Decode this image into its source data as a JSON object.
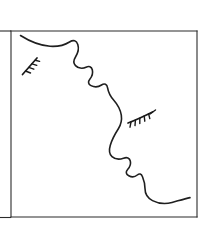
{
  "artwork": {
    "title": "Face in Profile Line Drawing",
    "description": "Minimal black ink line drawing of a human face seen in profile, contained in a thin rectangular frame, with two stylized eyelash marks.",
    "style": "line-art",
    "background_color": "#ffffff",
    "ink_color": "#1f1f1f",
    "frame_color": "#2b2b2b",
    "canvas": {
      "width": 209,
      "height": 233
    }
  },
  "frame": {
    "name": "rectangular-border",
    "left": 11,
    "top": 31,
    "right": 197,
    "bottom": 217,
    "stroke_width": 1.1,
    "color": "#2b2b2b"
  },
  "elements": {
    "profile_contour": {
      "label": "face-profile-contour",
      "color": "#1f1f1f",
      "stroke_width": 1.6,
      "segments": [
        "scalp",
        "forehead",
        "brow",
        "nose-bridge",
        "nose-tip",
        "upper-lip",
        "mouth",
        "lower-lip",
        "chin",
        "jaw-neck"
      ],
      "path": "M 20.5 35.5 C 30 41.5, 40 45.5, 50 46.3 C 58 46.8, 64.5 45.2, 69.5 42.0 C 73.5 39.5, 76.5 40.5, 77.8 44.5 C 79.0 48.2, 78.0 53.0, 75.5 57.0 C 73.6 60.0, 73.3 63.3, 75.5 65.6 C 78.0 68.2, 82.5 68.8, 86.0 67.2 C 89.0 65.8, 91.5 66.6, 92.3 69.8 C 93.1 73.0, 92.0 76.6, 89.8 79.2 C 87.8 81.6, 88.2 84.2, 91.0 85.6 C 94.2 87.2, 98.5 87.0, 101.5 85.0 C 104.5 83.0, 107.0 84.2, 107.6 87.8 C 108.4 92.5, 110.5 96.5, 113.8 100.2 C 117.8 104.7, 120.5 109.8, 121.3 115.2 C 122.0 120.0, 121.0 124.5, 118.5 128.5 C 115.0 134.0, 112.0 139.5, 110.3 145.2 C 108.8 150.3, 109.3 154.2, 112.0 156.6 C 114.8 159.1, 119.5 159.6, 123.5 158.2 C 127.0 157.0, 129.5 157.8, 130.3 161.0 C 131.0 163.8, 130.0 166.8, 127.8 169.2 C 125.5 171.7, 125.8 174.2, 128.8 175.8 C 131.8 177.4, 135.0 177.0, 137.3 175.0 C 139.5 173.2, 141.3 173.8, 142.5 176.8 C 144.0 180.5, 145.0 184.5, 145.0 188.5 C 145.0 193.8, 147.5 198.0, 152.5 200.6 C 158.5 203.7, 165.5 204.3, 172.0 202.5 C 178.5 200.7, 184.5 198.8, 190.0 197.6"
    },
    "left_eyelash": {
      "label": "left-eyelash-mark",
      "position": "upper-left",
      "orientation": "diagonal",
      "lash_count": 4,
      "color": "#1a1a1a",
      "spine": "M 22.5 74.5 L 37.0 58.0",
      "hairs": [
        "M 25.5 71.0 L 30.5 73.0",
        "M 28.8 67.4 L 33.8 69.2",
        "M 32.0 63.8 L 36.8 65.4",
        "M 35.2 60.2 L 39.6 61.4"
      ]
    },
    "right_eyelash": {
      "label": "right-eyelash-mark",
      "position": "middle-right",
      "orientation": "horizontal",
      "lash_count": 5,
      "color": "#1a1a1a",
      "spine": "M 128.0 123.0 C 136.0 120.0, 144.5 116.0, 152.5 112.0",
      "hairs": [
        "M 131.0 122.0 L 130.0 127.2",
        "M 135.4 120.2 L 135.0 125.6",
        "M 139.8 118.2 L 139.8 123.6",
        "M 144.2 116.0 L 144.8 121.2",
        "M 148.6 113.8 L 149.8 118.6"
      ],
      "tail": "M 150.0 114.0 L 155.5 110.0"
    },
    "left_margin_stub": {
      "label": "left-margin-stub",
      "description": "short horizontal rule fragment at left page margin",
      "path": "M 0 217.5 L 11 217.5",
      "color": "#2b2b2b"
    },
    "top_margin_stub": {
      "label": "top-margin-stub",
      "description": "short horizontal rule fragment at top-left page margin",
      "path": "M 0 31.0 L 11 31.0",
      "color": "#2b2b2b"
    }
  }
}
